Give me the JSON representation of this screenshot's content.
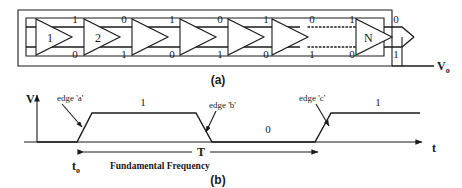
{
  "figure": {
    "panel_a": {
      "caption": "(a)",
      "output_label": "V",
      "output_sub": "o",
      "inverters": [
        {
          "label": "1"
        },
        {
          "label": "2"
        },
        {
          "label": ""
        },
        {
          "label": ""
        },
        {
          "label": ""
        },
        {
          "label": ""
        },
        {
          "label": "N"
        }
      ],
      "top_digits": [
        "1",
        "0",
        "1",
        "0",
        "1",
        "0",
        "1",
        "0"
      ],
      "bottom_digits": [
        "0",
        "1",
        "0",
        "1",
        "0",
        "1",
        "0",
        "1"
      ],
      "dotted_connection": true
    },
    "panel_b": {
      "caption": "(b)",
      "y_axis_label": "V",
      "x_axis_label": "t",
      "level_high_first": "1",
      "level_low": "0",
      "level_high_second": "1",
      "period_label": "T",
      "origin_label": "t",
      "origin_sub": "o",
      "fundamental_label": "Fundamental Frequency",
      "annotations": [
        {
          "text": "edge 'a'"
        },
        {
          "text": "edge 'b'"
        },
        {
          "text": "edge 'c'"
        }
      ]
    }
  },
  "colors": {
    "ink": "#1a1a1a",
    "background": "#ffffff"
  }
}
